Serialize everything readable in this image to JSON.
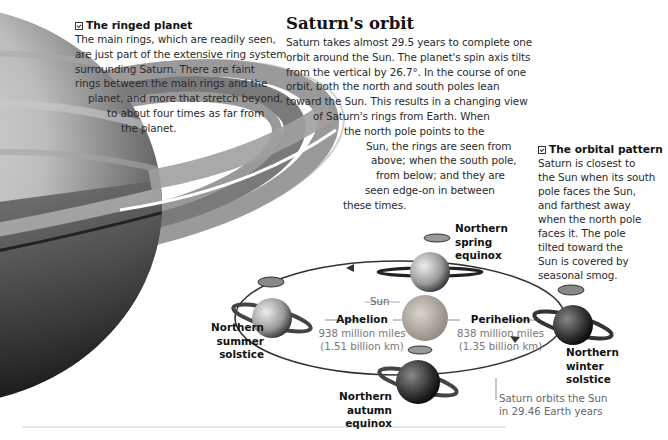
{
  "ringed_planet": {
    "heading": "The ringed planet",
    "lines": [
      "The main rings, which are readily seen,",
      "are just part of the extensive ring system",
      "surrounding Saturn.  There are faint",
      "rings between the main rings and the",
      "planet, and more that stretch beyond,",
      "to about four times as far from",
      "the planet."
    ]
  },
  "orbit": {
    "title": "Saturn's orbit",
    "lines": [
      "Saturn takes almost 29.5 years to complete one",
      "orbit around the Sun. The planet's spin axis tilts",
      "from the vertical by 26.7°. In the course of one",
      "orbit, both the north and south poles lean",
      "toward the Sun. This results in a changing view",
      "of Saturn's rings from Earth. When",
      "the north pole points to the",
      "Sun, the rings are seen from",
      "above; when the south pole,",
      "from below; and they are",
      "seen edge-on in between",
      "these times."
    ]
  },
  "orbital_pattern": {
    "heading": "The orbital pattern",
    "lines": [
      "Saturn is closest to",
      "the Sun when its south",
      "pole faces the Sun,",
      "and farthest away",
      "when the north pole",
      "faces it. The pole",
      "tilted toward the",
      "Sun is covered by",
      "seasonal smog."
    ]
  },
  "diagram": {
    "sun_label": "Sun",
    "spring": [
      "Northern",
      "spring",
      "equinox"
    ],
    "summer": [
      "Northern",
      "summer",
      "solstice"
    ],
    "winter": [
      "Northern",
      "winter",
      "solstice"
    ],
    "autumn": [
      "Northern",
      "autumn equinox"
    ],
    "aphelion": {
      "title": "Aphelion",
      "miles": "938 million miles",
      "km": "(1.51 billion km)"
    },
    "perihelion": {
      "title": "Perihelion",
      "miles": "838 million miles",
      "km": "(1.35 billion km)"
    },
    "orbit_caption": [
      "Saturn orbits the Sun",
      "in 29.46 Earth years"
    ]
  },
  "icons": {
    "section_marker": "checkbox-icon"
  },
  "colors": {
    "text": "#2a2a2a",
    "heading": "#111111",
    "caption": "#777777",
    "orbit_line": "#333333",
    "rule": "#cccccc"
  }
}
